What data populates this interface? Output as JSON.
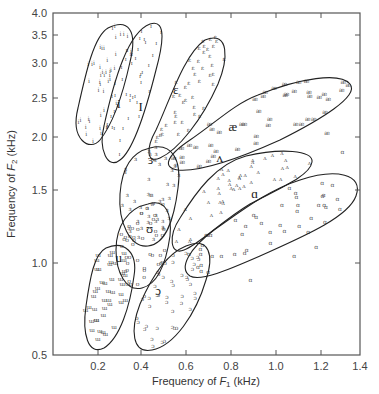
{
  "chart_data": {
    "type": "scatter",
    "title": "",
    "xlabel": "Frequency of F1 (kHz)",
    "ylabel": "Frequency of F2 (kHz)",
    "xlabel_parts": {
      "pre": "Frequency of ",
      "f": "F",
      "sub": "1",
      "post": " (kHz)"
    },
    "ylabel_parts": {
      "pre": "Frequency of ",
      "f": "F",
      "sub": "2",
      "post": " (kHz)"
    },
    "xlim": [
      0.0,
      1.4
    ],
    "ylim": [
      0.5,
      4.0
    ],
    "yscale": "log",
    "grid": false,
    "legend": "none",
    "x_ticks": [
      {
        "label": "0.2",
        "px": 98
      },
      {
        "label": "0.4",
        "px": 141
      },
      {
        "label": "0.6",
        "px": 186
      },
      {
        "label": "0.8",
        "px": 231
      },
      {
        "label": "1.0",
        "px": 276
      },
      {
        "label": "1.2",
        "px": 321
      },
      {
        "label": "1.4",
        "px": 360
      }
    ],
    "y_ticks": [
      {
        "label": "4.0",
        "py": 13
      },
      {
        "label": "3.5",
        "py": 35
      },
      {
        "label": "3.0",
        "py": 63
      },
      {
        "label": "2.5",
        "py": 98
      },
      {
        "label": "2.0",
        "py": 137
      },
      {
        "label": "1.5",
        "py": 190
      },
      {
        "label": "1.0",
        "py": 263
      },
      {
        "label": "0.5",
        "py": 355
      }
    ],
    "series": [
      {
        "name": "i",
        "symbol": "i",
        "label": "i",
        "label_pos": [
          0.3,
          2.25
        ],
        "centroid": {
          "F1": 0.3,
          "F2": 2.3
        },
        "ellipse": "M108,28 C128,18 138,30 130,62 C122,98 112,125 100,140 C90,152 70,140 78,108 C86,72 94,36 108,28 Z"
      },
      {
        "name": "ɪ",
        "symbol": "ɪ",
        "label": "I",
        "label_pos": [
          0.4,
          2.2
        ],
        "centroid": {
          "F1": 0.42,
          "F2": 2.05
        },
        "ellipse": "M150,24 C168,18 162,48 156,70 C146,110 134,150 120,160 C108,170 98,150 104,126 C114,80 128,32 150,24 Z"
      },
      {
        "name": "ɛ",
        "symbol": "ɛ",
        "label": "ɛ",
        "label_pos": [
          0.56,
          2.45
        ],
        "centroid": {
          "F1": 0.56,
          "F2": 2.15
        },
        "ellipse": "M205,40 C230,30 228,60 218,84 C202,120 178,150 160,158 C146,164 146,148 156,130 C170,100 184,54 205,40 Z"
      },
      {
        "name": "æ",
        "symbol": "æ",
        "label": "æ",
        "label_pos": [
          0.82,
          1.95
        ],
        "centroid": {
          "F1": 0.82,
          "F2": 1.9
        },
        "ellipse": "M258,95 C300,78 340,72 350,84 C360,96 320,120 280,140 C240,158 200,172 178,170 C162,168 166,156 190,140 C214,124 234,104 258,95 Z"
      },
      {
        "name": "ɝ",
        "symbol": "ɜ",
        "label": "ɝ",
        "label_pos": [
          0.45,
          1.6
        ],
        "centroid": {
          "F1": 0.47,
          "F2": 1.5
        },
        "ellipse": "M150,148 C172,142 182,160 178,188 C174,220 166,244 148,246 C130,248 118,222 120,194 C122,166 132,152 150,148 Z"
      },
      {
        "name": "ʌ",
        "symbol": "ʌ",
        "label": "ʌ",
        "label_pos": [
          0.76,
          1.62
        ],
        "centroid": {
          "F1": 0.72,
          "F2": 1.45
        },
        "ellipse": "M246,156 C280,148 314,150 312,162 C310,176 280,188 250,204 C220,222 200,244 184,250 C170,256 168,236 180,218 C196,192 216,164 246,156 Z"
      },
      {
        "name": "ɑ",
        "symbol": "ɑ",
        "label": "ɑ",
        "label_pos": [
          0.92,
          1.3
        ],
        "centroid": {
          "F1": 0.92,
          "F2": 1.25
        },
        "ellipse": "M300,180 C336,168 364,174 356,196 C348,218 300,238 260,256 C228,270 200,282 190,276 C178,268 190,248 214,230 C240,212 268,190 300,180 Z"
      },
      {
        "name": "ʊ",
        "symbol": "ʊ",
        "label": "ʊ",
        "label_pos": [
          0.44,
          1.05
        ],
        "centroid": {
          "F1": 0.45,
          "F2": 1.05
        },
        "ellipse": "M148,204 C166,198 172,214 170,236 C166,264 158,284 142,288 C126,292 116,272 116,250 C116,226 128,208 148,204 Z"
      },
      {
        "name": "u",
        "symbol": "ɯ",
        "label": "u",
        "label_pos": [
          0.3,
          0.88
        ],
        "centroid": {
          "F1": 0.3,
          "F2": 0.85
        },
        "ellipse": "M106,248 C124,240 138,252 134,276 C130,306 120,338 104,348 C88,356 82,334 86,306 C90,278 94,254 106,248 Z"
      },
      {
        "name": "ɔ",
        "symbol": "ɔ",
        "label": "ɔ",
        "label_pos": [
          0.48,
          0.72
        ],
        "centroid": {
          "F1": 0.5,
          "F2": 0.8
        },
        "ellipse": "M186,246 C210,236 214,256 206,280 C196,314 174,346 152,350 C132,354 130,330 140,304 C152,276 166,254 186,246 Z"
      }
    ]
  },
  "vowel_labels": [
    "i",
    "I",
    "ɛ",
    "æ",
    "ɝ",
    "ʌ",
    "ɑ",
    "ʊ",
    "u",
    "ɔ"
  ]
}
